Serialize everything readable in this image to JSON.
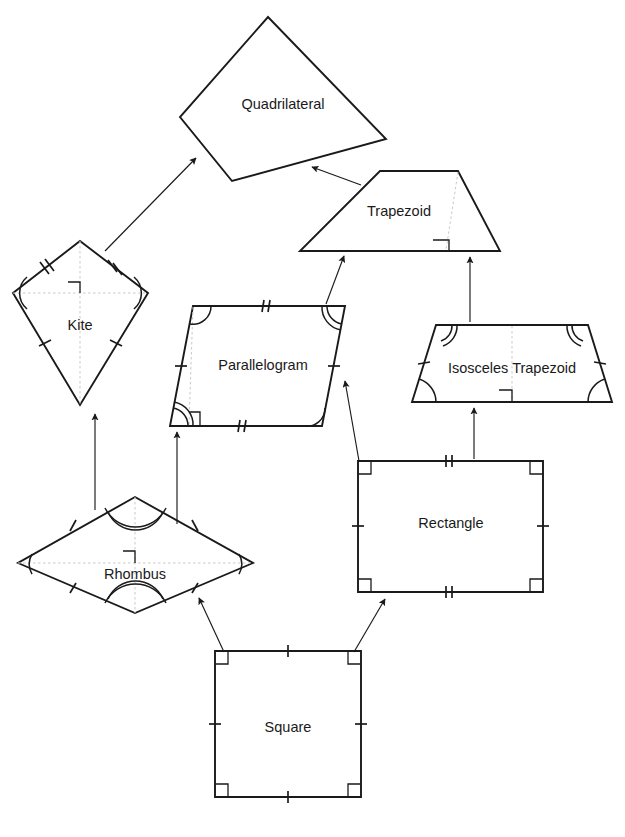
{
  "diagram": {
    "background_color": "#ffffff",
    "stroke_color": "#1a1a1a",
    "guide_color": "#c9c9c9",
    "shapes": [
      {
        "id": "quadrilateral",
        "label": "Quadrilateral",
        "type": "irregular-quadrilateral",
        "label_x": 283,
        "label_y": 105,
        "points": "268,17 386,139 232,181 180,117",
        "marks": {
          "ticks": "none",
          "angle_arcs": "none",
          "right_angle": false,
          "guides": false
        }
      },
      {
        "id": "trapezoid",
        "label": "Trapezoid",
        "type": "trapezoid",
        "label_x": 399,
        "label_y": 212,
        "points": "380,171 458,171 500,251 300,251",
        "marks": {
          "ticks": "none",
          "angle_arcs": "none",
          "right_angle": true,
          "guides": true
        }
      },
      {
        "id": "kite",
        "label": "Kite",
        "type": "kite",
        "label_x": 80,
        "label_y": 326,
        "points": "80,241 148,293 80,405 13,293",
        "marks": {
          "ticks": "two-upper-one-lower",
          "angle_arcs": "left-right",
          "right_angle": true,
          "guides": true
        }
      },
      {
        "id": "parallelogram",
        "label": "Parallelogram",
        "type": "parallelogram",
        "label_x": 263,
        "label_y": 366,
        "points": "193,306 345,306 322,426 170,426",
        "marks": {
          "ticks": "double-top-bottom-single-sides",
          "angle_arcs": "four-corners",
          "right_angle": true,
          "guides": true
        }
      },
      {
        "id": "isosceles-trapezoid",
        "label": "Isosceles Trapezoid",
        "type": "isosceles-trapezoid",
        "label_x": 512,
        "label_y": 369,
        "points": "436,325 588,325 612,402 412,402",
        "marks": {
          "ticks": "both-legs",
          "angle_arcs": "four-corners",
          "right_angle": true,
          "guides": true
        }
      },
      {
        "id": "rhombus",
        "label": "Rhombus",
        "type": "rhombus",
        "label_x": 135,
        "label_y": 575,
        "points": "135,497 253,563 135,613 18,563",
        "marks": {
          "ticks": "all-four-sides",
          "angle_arcs": "four-vertices",
          "right_angle": true,
          "guides": true
        }
      },
      {
        "id": "rectangle",
        "label": "Rectangle",
        "type": "rectangle",
        "label_x": 451,
        "label_y": 524,
        "points": "358,461 543,461 543,592 358,592",
        "marks": {
          "ticks": "double-top-bottom-single-sides",
          "angle_arcs": "none",
          "right_angle": true,
          "guides": false
        }
      },
      {
        "id": "square",
        "label": "Square",
        "type": "square",
        "label_x": 288,
        "label_y": 728,
        "points": "215,651 361,651 361,797 215,797",
        "marks": {
          "ticks": "all-four-sides",
          "angle_arcs": "none",
          "right_angle": true,
          "guides": false
        }
      }
    ],
    "connections": [
      {
        "id": "kite-to-quadrilateral",
        "from": "kite",
        "to": "quadrilateral",
        "x1": 105,
        "y1": 251,
        "x2": 196,
        "y2": 158
      },
      {
        "id": "trapezoid-to-quadrilateral",
        "from": "trapezoid",
        "to": "quadrilateral",
        "x1": 359,
        "y1": 183,
        "x2": 312,
        "y2": 167
      },
      {
        "id": "parallelogram-to-trapezoid",
        "from": "parallelogram",
        "to": "trapezoid",
        "x1": 326,
        "y1": 304,
        "x2": 343,
        "y2": 255
      },
      {
        "id": "isosceles-trapezoid-to-trapezoid",
        "from": "isosceles-trapezoid",
        "to": "trapezoid",
        "x1": 470,
        "y1": 322,
        "x2": 470,
        "y2": 256
      },
      {
        "id": "rhombus-to-kite",
        "from": "rhombus",
        "to": "kite",
        "x1": 95,
        "y1": 508,
        "x2": 95,
        "y2": 414
      },
      {
        "id": "rhombus-to-parallelogram",
        "from": "rhombus",
        "to": "parallelogram",
        "x1": 177,
        "y1": 523,
        "x2": 177,
        "y2": 431
      },
      {
        "id": "rectangle-to-parallelogram",
        "from": "rectangle",
        "to": "parallelogram",
        "x1": 358,
        "y1": 461,
        "x2": 345,
        "y2": 380
      },
      {
        "id": "rectangle-to-isosceles-trapezoid",
        "from": "rectangle",
        "to": "isosceles-trapezoid",
        "x1": 474,
        "y1": 459,
        "x2": 474,
        "y2": 407
      },
      {
        "id": "square-to-rhombus",
        "from": "square",
        "to": "rhombus",
        "x1": 222,
        "y1": 651,
        "x2": 198,
        "y2": 597
      },
      {
        "id": "square-to-rectangle",
        "from": "square",
        "to": "rectangle",
        "x1": 355,
        "y1": 651,
        "x2": 385,
        "y2": 598
      }
    ]
  }
}
